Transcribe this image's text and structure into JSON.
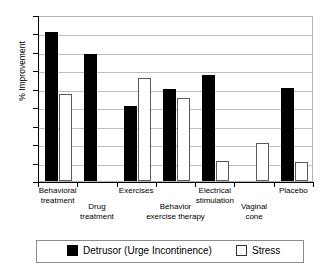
{
  "chart_data": {
    "type": "bar",
    "title": "",
    "subtitle": "",
    "xlabel": "",
    "ylabel": "% Improvement",
    "ylim": [
      0,
      90
    ],
    "ytick_step": 10,
    "yticks": [
      0,
      10,
      20,
      30,
      40,
      50,
      60,
      70,
      80,
      90
    ],
    "grid": true,
    "legend_position": "bottom",
    "categories": [
      "Behavioral treatment",
      "Drug treatment",
      "Exercises",
      "Behavior exercise therapy",
      "Electrical stimulation",
      "Vaginal cone",
      "Placebo"
    ],
    "series": [
      {
        "name": "Detrusor (Urge Incontinence)",
        "color": "#000000",
        "values": [
          81,
          69,
          40.5,
          50,
          57.5,
          null,
          50.5
        ]
      },
      {
        "name": "Stress",
        "color": "#ffffff",
        "values": [
          47,
          null,
          56,
          45,
          11,
          20.5,
          10.5
        ]
      }
    ]
  },
  "axis": {
    "y_title": "% Improvement",
    "y_tick_labels": [
      "0",
      "10",
      "20",
      "30",
      "40",
      "50",
      "60",
      "70",
      "80",
      "90"
    ]
  },
  "categories_display": [
    {
      "line1": "Behavioral",
      "line2": "treatment"
    },
    {
      "line1": "Drug",
      "line2": "treatment"
    },
    {
      "line1": "Exercises",
      "line2": ""
    },
    {
      "line1": "Behavior",
      "line2": "exercise therapy"
    },
    {
      "line1": "Electrical",
      "line2": "stimulation"
    },
    {
      "line1": "Vaginal",
      "line2": "cone"
    },
    {
      "line1": "Placebo",
      "line2": ""
    }
  ],
  "legend": {
    "entries": [
      {
        "label": "Detrusor (Urge Incontinence)",
        "swatch": "filled"
      },
      {
        "label": "Stress",
        "swatch": "hollow"
      }
    ]
  }
}
